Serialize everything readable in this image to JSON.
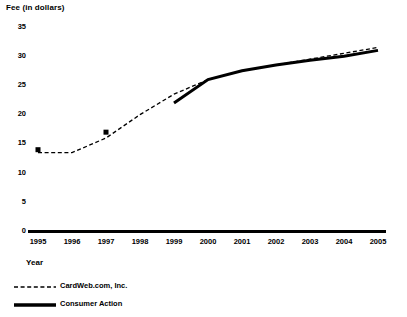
{
  "chart_data": {
    "type": "line",
    "title": "",
    "xlabel": "Year",
    "ylabel": "Fee (in dollars)",
    "x": [
      1995,
      1996,
      1997,
      1998,
      1999,
      2000,
      2001,
      2002,
      2003,
      2004,
      2005
    ],
    "xticklabels": [
      "1995",
      "1996",
      "1997",
      "1998",
      "1999",
      "2000",
      "2001",
      "2002",
      "2003",
      "2004",
      "2005"
    ],
    "yticklabels": [
      "0",
      "5",
      "10",
      "15",
      "20",
      "25",
      "30",
      "35"
    ],
    "yticks": [
      0,
      5,
      10,
      15,
      20,
      25,
      30,
      35
    ],
    "ylim": [
      0,
      35
    ],
    "xlim": [
      1995,
      2005
    ],
    "grid": false,
    "legend_position": "below-left",
    "series": [
      {
        "name": "CardWeb.com, Inc.",
        "style": "dashed",
        "color": "#000000",
        "x": [
          1995,
          1996,
          1997,
          1998,
          1999,
          2000,
          2001,
          2002,
          2003,
          2004,
          2005
        ],
        "values": [
          13.5,
          13.5,
          16.0,
          20.0,
          23.5,
          26.0,
          27.5,
          28.5,
          29.5,
          30.5,
          31.5
        ],
        "markers": [
          {
            "x": 1995,
            "y": 14.0
          },
          {
            "x": 1997,
            "y": 17.0
          }
        ]
      },
      {
        "name": "Consumer Action",
        "style": "solid-thick",
        "color": "#000000",
        "x": [
          1999,
          2000,
          2001,
          2002,
          2003,
          2004,
          2005
        ],
        "values": [
          22.0,
          26.0,
          27.5,
          28.5,
          29.3,
          30.0,
          31.0
        ],
        "markers": []
      }
    ]
  },
  "legend": {
    "entries": [
      {
        "label": "CardWeb.com, Inc."
      },
      {
        "label": "Consumer Action"
      }
    ]
  },
  "axes": {
    "y_title": "Fee (in dollars)",
    "x_title": "Year"
  }
}
